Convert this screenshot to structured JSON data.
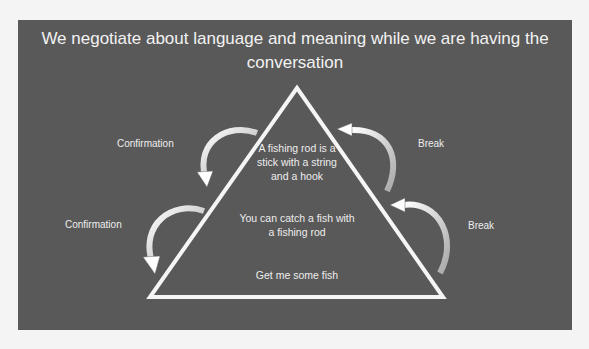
{
  "slide": {
    "title": "We negotiate about language and meaning while we are having the conversation",
    "background_color": "#595959"
  },
  "pyramid": {
    "levels": [
      {
        "text": "A fishing rod is a stick with a string and a hook",
        "position": "top"
      },
      {
        "text": "You can catch a fish with a fishing rod",
        "position": "middle"
      },
      {
        "text": "Get me some fish",
        "position": "bottom"
      }
    ]
  },
  "left_labels": [
    {
      "text": "Confirmation",
      "arrow": "curved-arrow-down-into-triangle"
    },
    {
      "text": "Confirmation",
      "arrow": "curved-arrow-down-into-triangle"
    }
  ],
  "right_labels": [
    {
      "text": "Break",
      "arrow": "curved-arrow-up-toward-triangle"
    },
    {
      "text": "Break",
      "arrow": "curved-arrow-up-toward-triangle"
    }
  ]
}
